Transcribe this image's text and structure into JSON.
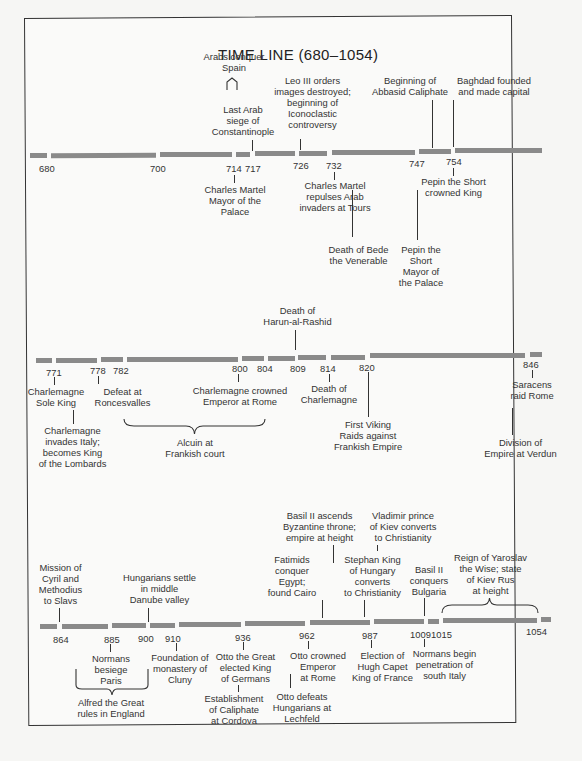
{
  "title": "TIME LINE (680–1054)",
  "rows": [
    {
      "years": [
        {
          "label": "680",
          "x": 39,
          "y": 163
        },
        {
          "label": "700",
          "x": 150,
          "y": 163
        },
        {
          "label": "714",
          "x": 226,
          "y": 163
        },
        {
          "label": "717",
          "x": 245,
          "y": 163
        },
        {
          "label": "726",
          "x": 293,
          "y": 160
        },
        {
          "label": "732",
          "x": 326,
          "y": 160
        },
        {
          "label": "747",
          "x": 409,
          "y": 158
        },
        {
          "label": "754",
          "x": 446,
          "y": 156
        }
      ],
      "events_above": [
        {
          "text": "Arabs conquer\nSpain",
          "x": 194,
          "y": 51,
          "w": 80
        },
        {
          "text": "Last Arab\nsiege of\nConstantinople",
          "x": 203,
          "y": 126,
          "w": 80
        },
        {
          "text": "Leo III orders\nimages destroyed;\nbeginning of\nIconoclastic\ncontroversy",
          "x": 265,
          "y": 101,
          "w": 95
        },
        {
          "text": "Beginning of\nAbbasid Caliphate",
          "x": 360,
          "y": 75,
          "w": 100
        },
        {
          "text": "Baghdad founded\nand made capital",
          "x": 444,
          "y": 75,
          "w": 100
        }
      ],
      "events_below": [
        {
          "text": "Charles Martel\nMayor of the\nPalace",
          "x": 200,
          "y": 184,
          "w": 80
        },
        {
          "text": "Charles Martel\nrepulses Arab\ninvaders at Tours",
          "x": 297,
          "y": 184,
          "w": 90
        },
        {
          "text": "Death of Bede\nthe Venerable",
          "x": 316,
          "y": 245,
          "w": 85
        },
        {
          "text": "Pepin the\nShort\nMayor of\nthe Palace",
          "x": 391,
          "y": 245,
          "w": 60
        },
        {
          "text": "Pepin the Short\ncrowned King",
          "x": 419,
          "y": 177,
          "w": 85
        }
      ]
    },
    {
      "years": [
        {
          "label": "771",
          "x": 46,
          "y": 367
        },
        {
          "label": "778",
          "x": 90,
          "y": 365
        },
        {
          "label": "782",
          "x": 113,
          "y": 365
        },
        {
          "label": "800",
          "x": 232,
          "y": 363
        },
        {
          "label": "804",
          "x": 257,
          "y": 363
        },
        {
          "label": "809",
          "x": 290,
          "y": 363
        },
        {
          "label": "814",
          "x": 320,
          "y": 363
        },
        {
          "label": "820",
          "x": 359,
          "y": 362
        },
        {
          "label": "846",
          "x": 523,
          "y": 359
        }
      ],
      "events_above": [
        {
          "text": "Death of\nHarun-al-Rashid",
          "x": 255,
          "y": 305,
          "w": 85
        }
      ],
      "events_below": [
        {
          "text": "Charlemagne\nSole King",
          "x": 29,
          "y": 386,
          "w": 70
        },
        {
          "text": "Charlemagne\ninvades Italy;\nbecomes King\nof the Lombards",
          "x": 26,
          "y": 425,
          "w": 85
        },
        {
          "text": "Defeat at\nRoncesvalles",
          "x": 89,
          "y": 386,
          "w": 65
        },
        {
          "text": "Charlemagne crowned\nEmperor at Rome",
          "x": 180,
          "y": 385,
          "w": 120
        },
        {
          "text": "Alcuin at\nFrankish court",
          "x": 155,
          "y": 437,
          "w": 80
        },
        {
          "text": "Death of\nCharlemagne",
          "x": 295,
          "y": 385,
          "w": 70
        },
        {
          "text": "First Viking\nRaids against\nFrankish Empire",
          "x": 325,
          "y": 420,
          "w": 80
        },
        {
          "text": "Saracens\nraid Rome",
          "x": 502,
          "y": 380,
          "w": 60
        },
        {
          "text": "Division of\nEmpire at Verdun",
          "x": 473,
          "y": 437,
          "w": 95
        }
      ]
    },
    {
      "years": [
        {
          "label": "864",
          "x": 53,
          "y": 634
        },
        {
          "label": "885",
          "x": 104,
          "y": 634
        },
        {
          "label": "900",
          "x": 138,
          "y": 633
        },
        {
          "label": "910",
          "x": 165,
          "y": 633
        },
        {
          "label": "936",
          "x": 235,
          "y": 632
        },
        {
          "label": "962",
          "x": 299,
          "y": 630
        },
        {
          "label": "987",
          "x": 362,
          "y": 630
        },
        {
          "label": "1009",
          "x": 410,
          "y": 629
        },
        {
          "label": "1015",
          "x": 431,
          "y": 629
        },
        {
          "label": "1054",
          "x": 526,
          "y": 626
        }
      ],
      "events_above": [
        {
          "text": "Mission of\nCyril and\nMethodius\nto Slavs",
          "x": 33,
          "y": 562,
          "w": 55
        },
        {
          "text": "Hungarians settle\nin middle\nDanube valley",
          "x": 112,
          "y": 572,
          "w": 95
        },
        {
          "text": "Basil II ascends\nByzantine throne;\nempire at height",
          "x": 272,
          "y": 510,
          "w": 95
        },
        {
          "text": "Fatimids\nconquer\nEgypt;\nfound Cairo",
          "x": 262,
          "y": 554,
          "w": 60
        },
        {
          "text": "Vladimir prince\nof Kiev converts\nto Christianity",
          "x": 358,
          "y": 510,
          "w": 90
        },
        {
          "text": "Stephan King\nof Hungary\nconverts\nto Christianity",
          "x": 330,
          "y": 554,
          "w": 85
        },
        {
          "text": "Basil II\nconquers\nBulgaria",
          "x": 399,
          "y": 564,
          "w": 60
        },
        {
          "text": "Reign of Yaroslav\nthe Wise; state\nof Kiev Rus\nat height",
          "x": 443,
          "y": 552,
          "w": 95
        }
      ],
      "events_below": [
        {
          "text": "Normans\nbesiege\nParis",
          "x": 83,
          "y": 654,
          "w": 60
        },
        {
          "text": "Alfred the Great\nrules in England",
          "x": 72,
          "y": 697,
          "w": 90
        },
        {
          "text": "Foundation of\nmonastery of\nCluny",
          "x": 146,
          "y": 652,
          "w": 80
        },
        {
          "text": "Otto the Great\nelected King\nof Germans",
          "x": 206,
          "y": 652,
          "w": 85
        },
        {
          "text": "Establishment\nof Caliphate\nat Cordova",
          "x": 194,
          "y": 693,
          "w": 80
        },
        {
          "text": "Otto crowned\nEmperor\nat Rome",
          "x": 280,
          "y": 651,
          "w": 80
        },
        {
          "text": "Otto defeats\nHungarians at\nLechfeld",
          "x": 261,
          "y": 691,
          "w": 80
        },
        {
          "text": "Election of\nHugh Capet\nKing of France",
          "x": 340,
          "y": 650,
          "w": 85
        },
        {
          "text": "Normans begin\npenetration of\nsouth Italy",
          "x": 404,
          "y": 649,
          "w": 85
        }
      ]
    }
  ],
  "colors": {
    "bar": "#8a8a8a",
    "ink": "#333333",
    "paper": "#fafaf9"
  }
}
